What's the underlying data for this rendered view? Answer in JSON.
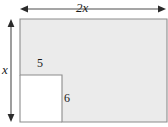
{
  "figure": {
    "type": "geometry-diagram",
    "colors": {
      "fill": "#ebebeb",
      "stroke": "#8c8c8c",
      "arrow": "#4d4d4d",
      "text": "#1a1a1a",
      "background": "#ffffff"
    },
    "outer_rectangle": {
      "width_label": "2x",
      "height_label": "x"
    },
    "notch_rectangle": {
      "top_label": "5",
      "side_label": "6"
    }
  },
  "labels": {
    "width": "2x",
    "height": "x",
    "notch_top": "5",
    "notch_side": "6"
  }
}
